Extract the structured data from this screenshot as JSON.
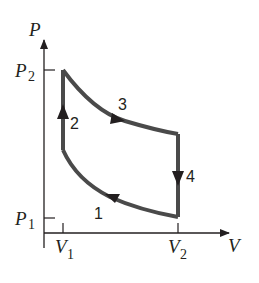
{
  "diagram": {
    "type": "pv-cycle",
    "axes": {
      "y_label": "P",
      "x_label": "V",
      "y_ticks": [
        {
          "base": "P",
          "sub": "2"
        },
        {
          "base": "P",
          "sub": "1"
        }
      ],
      "x_ticks": [
        {
          "base": "V",
          "sub": "1"
        },
        {
          "base": "V",
          "sub": "2"
        }
      ]
    },
    "processes": [
      {
        "label": "1",
        "description": "curved compression from (V2,P1) to (V1, intermediate P)"
      },
      {
        "label": "2",
        "description": "vertical increase at V1 up to P2"
      },
      {
        "label": "3",
        "description": "curved expansion from (V1,P2) to (V2, intermediate P)"
      },
      {
        "label": "4",
        "description": "vertical decrease at V2 down to P1"
      }
    ],
    "colors": {
      "cycle_stroke": "#4a4a4a",
      "axis_stroke": "#231f20"
    }
  }
}
